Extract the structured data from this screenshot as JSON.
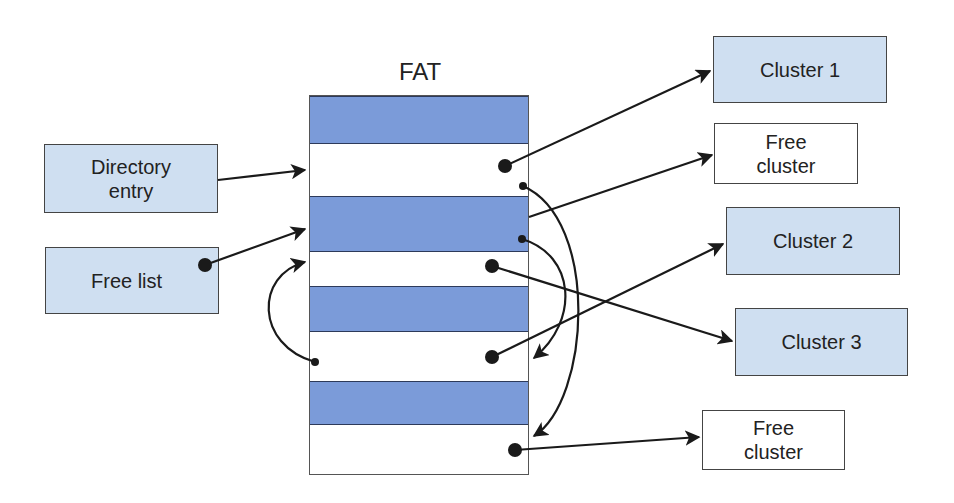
{
  "diagram": {
    "fat_title": "FAT",
    "colors": {
      "used_row": "#7b9bd9",
      "cluster_box": "#cfdff1",
      "free_box": "#ffffff",
      "line": "#1a1a1a"
    },
    "left_boxes": {
      "directory_entry": {
        "line1": "Directory",
        "line2": "entry"
      },
      "free_list": {
        "label": "Free list"
      }
    },
    "fat_rows": [
      {
        "index": 0,
        "state": "used"
      },
      {
        "index": 1,
        "state": "free"
      },
      {
        "index": 2,
        "state": "used"
      },
      {
        "index": 3,
        "state": "free"
      },
      {
        "index": 4,
        "state": "used"
      },
      {
        "index": 5,
        "state": "free"
      },
      {
        "index": 6,
        "state": "used"
      },
      {
        "index": 7,
        "state": "free"
      }
    ],
    "right_boxes": {
      "cluster_1": {
        "label": "Cluster 1"
      },
      "free_cluster_top": {
        "line1": "Free",
        "line2": "cluster"
      },
      "cluster_2": {
        "label": "Cluster 2"
      },
      "cluster_3": {
        "label": "Cluster 3"
      },
      "free_cluster_bottom": {
        "line1": "Free",
        "line2": "cluster"
      }
    },
    "connections": [
      {
        "from": "Directory entry",
        "to": "FAT entry 1"
      },
      {
        "from": "Free list",
        "to": "FAT entry 2"
      },
      {
        "from": "FAT entry 1",
        "to": "Cluster 1"
      },
      {
        "from": "FAT entry 1",
        "to": "FAT entry 5"
      },
      {
        "from": "FAT entry 2",
        "to": "Free cluster (top)"
      },
      {
        "from": "FAT entry 2",
        "to": "FAT entry 7"
      },
      {
        "from": "FAT entry 3",
        "to": "Cluster 3"
      },
      {
        "from": "FAT entry 5",
        "to": "Cluster 2"
      },
      {
        "from": "FAT entry 5",
        "to": "FAT entry 3"
      },
      {
        "from": "FAT entry 7",
        "to": "Free cluster (bottom)"
      }
    ]
  }
}
